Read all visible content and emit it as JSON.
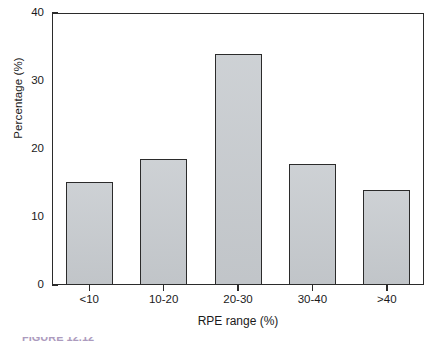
{
  "chart_data": {
    "type": "bar",
    "title": "",
    "categories": [
      "<10",
      "10-20",
      "20-30",
      "30-40",
      ">40"
    ],
    "values": [
      15.1,
      18.5,
      34.0,
      17.8,
      14.0
    ],
    "xlabel": "RPE range (%)",
    "ylabel": "Percentage (%)",
    "ylim": [
      0,
      40
    ],
    "yticks": [
      0,
      10,
      20,
      30,
      40
    ],
    "ytick_labels": [
      "0",
      "10",
      "20",
      "30",
      "40"
    ],
    "grid": false,
    "legend": null,
    "bar_fill_color": "#c8ccd0",
    "bar_edge_color": "#2b2b2b",
    "axis_color": "#2b2b2b",
    "background_color": "#ffffff"
  },
  "axes": {
    "y_title": "Percentage (%)",
    "x_title": "RPE range (%)"
  },
  "caption": {
    "figure_label": "FIGURE",
    "text": "FIGURE 12.12"
  }
}
